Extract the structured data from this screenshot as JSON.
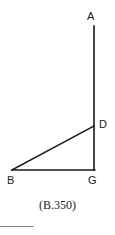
{
  "figure": {
    "caption": "(B.350)",
    "background_color": "#ffffff",
    "stroke_color": "#1a1a1a",
    "rule_color": "#8a8a8a",
    "points": {
      "A": {
        "label": "A",
        "x": 94,
        "y": 26
      },
      "D": {
        "label": "D",
        "x": 94,
        "y": 126
      },
      "B": {
        "label": "B",
        "x": 12,
        "y": 170
      },
      "G": {
        "label": "G",
        "x": 94,
        "y": 170
      }
    },
    "segments": [
      {
        "name": "segment-A-G",
        "from": "A",
        "to": "G"
      },
      {
        "name": "segment-B-G",
        "from": "B",
        "to": "G"
      },
      {
        "name": "segment-B-D",
        "from": "B",
        "to": "D"
      }
    ]
  }
}
